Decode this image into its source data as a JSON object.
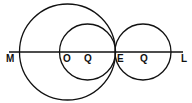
{
  "diagram": {
    "stroke_color": "#111111",
    "background": "#ffffff",
    "labels": {
      "M": "M",
      "O": "O",
      "Q1": "Q",
      "E": "E",
      "Q2": "Q",
      "L": "L"
    },
    "line": {
      "x1": 9,
      "y1": 52,
      "x2": 183,
      "y2": 52
    },
    "circles": [
      {
        "name": "large-circle",
        "cx": 67.5,
        "cy": 52,
        "r": 48
      },
      {
        "name": "inner-circle",
        "cx": 87.5,
        "cy": 52,
        "r": 28
      },
      {
        "name": "right-circle",
        "cx": 143,
        "cy": 52,
        "r": 28
      }
    ]
  }
}
